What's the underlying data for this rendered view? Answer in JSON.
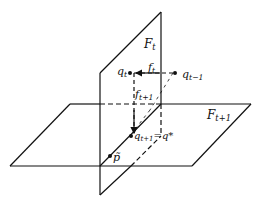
{
  "diagram": {
    "title": "",
    "colors": {
      "line": "#111111",
      "background": "#ffffff"
    },
    "planes": [
      {
        "name": "vertical-plane",
        "label": "F",
        "subscript": "t"
      },
      {
        "name": "horizontal-plane",
        "label": "F",
        "subscript": "t+1"
      }
    ],
    "points": [
      {
        "name": "q_t",
        "label": "q",
        "subscript": "t"
      },
      {
        "name": "q_t-1",
        "label": "q",
        "subscript": "t−1"
      },
      {
        "name": "q_t+1",
        "label": "q",
        "subscript": "t+1",
        "suffix": "=q*"
      },
      {
        "name": "p_tilde",
        "label": "p̃",
        "subscript": ""
      }
    ],
    "arrows": [
      {
        "name": "f_t",
        "label": "f",
        "subscript": "t"
      },
      {
        "name": "f_t+1",
        "label": "f",
        "subscript": "t+1"
      }
    ]
  }
}
